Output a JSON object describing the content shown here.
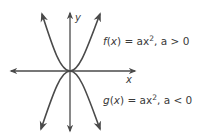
{
  "diagram": {
    "axes": {
      "x_label": "x",
      "y_label": "y"
    },
    "curves": [
      {
        "name": "f",
        "equation_fn": "f",
        "equation_var": "x",
        "equation_rhs": "ax",
        "exponent": "2",
        "condition": ", a > 0",
        "opens": "up"
      },
      {
        "name": "g",
        "equation_fn": "g",
        "equation_var": "x",
        "equation_rhs": "ax",
        "exponent": "2",
        "condition": ", a < 0",
        "opens": "down"
      }
    ],
    "colors": {
      "stroke": "#4a4a4a",
      "text": "#3a3a3a",
      "background": "#ffffff"
    }
  }
}
